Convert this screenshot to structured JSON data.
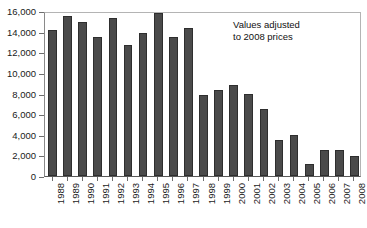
{
  "chart_data": {
    "type": "bar",
    "title": "",
    "xlabel": "",
    "ylabel": "",
    "ylim": [
      0,
      16000
    ],
    "ytick_values": [
      0,
      2000,
      4000,
      6000,
      8000,
      10000,
      12000,
      14000,
      16000
    ],
    "ytick_labels": [
      "0",
      "2,000",
      "4,000",
      "6,000",
      "8,000",
      "10,000",
      "12,000",
      "14,000",
      "16,000"
    ],
    "grid": false,
    "legend": null,
    "bar_color": "#4a4a4a",
    "bar_edge_color": "#2e2e2e",
    "categories": [
      "1988",
      "1989",
      "1990",
      "1991",
      "1992",
      "1993",
      "1994",
      "1995",
      "1996",
      "1997",
      "1998",
      "1999",
      "2000",
      "2001",
      "2002",
      "2003",
      "2004",
      "2005",
      "2006",
      "2007",
      "2008"
    ],
    "values": [
      14200,
      15500,
      14900,
      13500,
      15300,
      12700,
      13900,
      15800,
      13500,
      14400,
      7900,
      8300,
      8800,
      8000,
      6500,
      3500,
      4000,
      1200,
      2500,
      2500,
      1900
    ],
    "annotations": [
      {
        "text": "Values adjusted\nto 2008 prices",
        "x_category": "2002",
        "y_value": 15000
      }
    ]
  }
}
